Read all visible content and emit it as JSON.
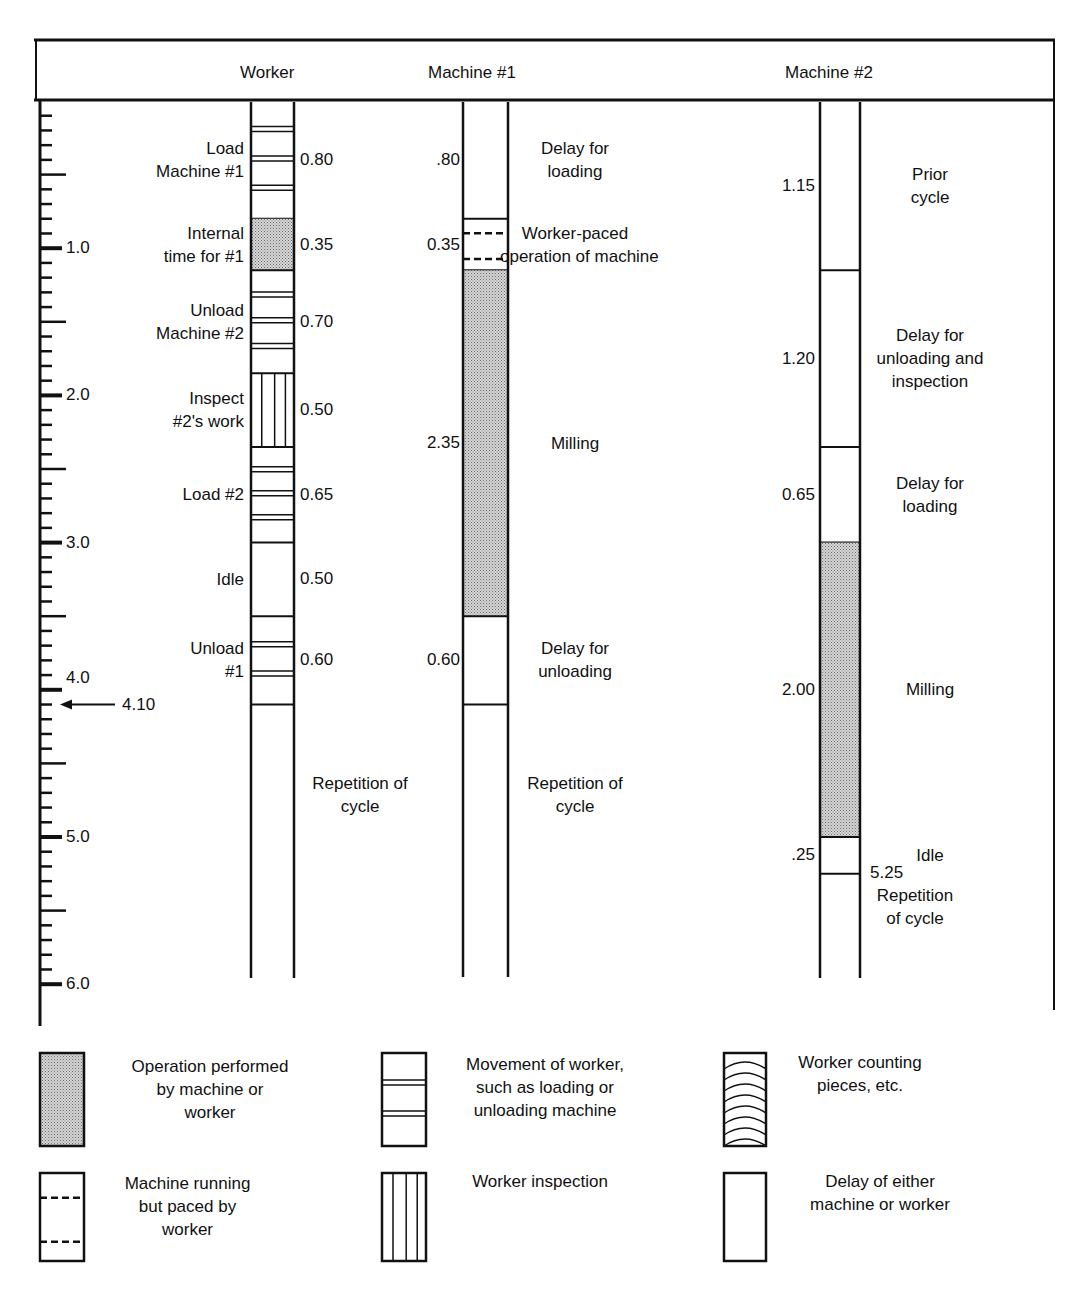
{
  "header": {
    "worker": "Worker",
    "machine1": "Machine #1",
    "machine2": "Machine #2"
  },
  "axis": {
    "ticks": [
      "1.0",
      "2.0",
      "3.0",
      "4.0",
      "5.0",
      "6.0"
    ],
    "marker_label": "4.10",
    "marker_value": 4.1,
    "min": 0,
    "max": 6.0,
    "minor_step": 0.1
  },
  "worker": {
    "segments": [
      {
        "label": "Load\nMachine #1",
        "duration": "0.80",
        "type": "movement"
      },
      {
        "label": "Internal\ntime for #1",
        "duration": "0.35",
        "type": "operation"
      },
      {
        "label": "Unload\nMachine #2",
        "duration": "0.70",
        "type": "movement"
      },
      {
        "label": "Inspect\n#2's work",
        "duration": "0.50",
        "type": "inspection"
      },
      {
        "label": "Load #2",
        "duration": "0.65",
        "type": "movement"
      },
      {
        "label": "Idle",
        "duration": "0.50",
        "type": "delay"
      },
      {
        "label": "Unload\n#1",
        "duration": "0.60",
        "type": "movement"
      }
    ],
    "repetition": "Repetition of\ncycle"
  },
  "machine1": {
    "segments": [
      {
        "label": "Delay for\nloading",
        "duration": ".80",
        "type": "delay"
      },
      {
        "label": "Worker-paced\noperation of machine",
        "duration": "0.35",
        "type": "paced"
      },
      {
        "label": "Milling",
        "duration": "2.35",
        "type": "operation"
      },
      {
        "label": "Delay for\nunloading",
        "duration": "0.60",
        "type": "delay"
      }
    ],
    "repetition": "Repetition of\ncycle"
  },
  "machine2": {
    "segments": [
      {
        "label": "Prior\ncycle",
        "duration": "1.15",
        "type": "delay"
      },
      {
        "label": "Delay for\nunloading and\ninspection",
        "duration": "1.20",
        "type": "delay"
      },
      {
        "label": "Delay for\nloading",
        "duration": "0.65",
        "type": "delay"
      },
      {
        "label": "Milling",
        "duration": "2.00",
        "type": "operation"
      },
      {
        "label": "Idle",
        "duration": ".25",
        "type": "delay"
      }
    ],
    "end_time": "5.25",
    "repetition": "Repetition\nof cycle"
  },
  "legend": [
    {
      "symbol": "operation",
      "label": "Operation performed\nby machine or\nworker"
    },
    {
      "symbol": "movement",
      "label": "Movement of worker,\nsuch as loading or\nunloading machine"
    },
    {
      "symbol": "counting",
      "label": "Worker counting\npieces, etc."
    },
    {
      "symbol": "paced",
      "label": "Machine running\nbut paced by\nworker"
    },
    {
      "symbol": "inspection",
      "label": "Worker inspection"
    },
    {
      "symbol": "delay",
      "label": "Delay of either\nmachine or worker"
    }
  ],
  "chart_data": {
    "type": "table",
    "columns": [
      "Worker",
      "Machine #1",
      "Machine #2"
    ],
    "axis": {
      "label": "time",
      "ticks": [
        1.0,
        2.0,
        3.0,
        4.0,
        5.0,
        6.0
      ],
      "range": [
        0,
        6.0
      ]
    },
    "cycle_time_marker": 4.1,
    "worker": [
      {
        "activity": "Load Machine #1",
        "start": 0.0,
        "duration": 0.8,
        "symbol": "movement"
      },
      {
        "activity": "Internal time for #1",
        "start": 0.8,
        "duration": 0.35,
        "symbol": "operation"
      },
      {
        "activity": "Unload Machine #2",
        "start": 1.15,
        "duration": 0.7,
        "symbol": "movement"
      },
      {
        "activity": "Inspect #2's work",
        "start": 1.85,
        "duration": 0.5,
        "symbol": "inspection"
      },
      {
        "activity": "Load #2",
        "start": 2.35,
        "duration": 0.65,
        "symbol": "movement"
      },
      {
        "activity": "Idle",
        "start": 3.0,
        "duration": 0.5,
        "symbol": "delay"
      },
      {
        "activity": "Unload #1",
        "start": 3.5,
        "duration": 0.6,
        "symbol": "movement"
      }
    ],
    "machine1": [
      {
        "activity": "Delay for loading",
        "start": 0.0,
        "duration": 0.8,
        "symbol": "delay"
      },
      {
        "activity": "Worker-paced operation of machine",
        "start": 0.8,
        "duration": 0.35,
        "symbol": "paced"
      },
      {
        "activity": "Milling",
        "start": 1.15,
        "duration": 2.35,
        "symbol": "operation"
      },
      {
        "activity": "Delay for unloading",
        "start": 3.5,
        "duration": 0.6,
        "symbol": "delay"
      }
    ],
    "machine2": [
      {
        "activity": "Prior cycle",
        "start": 0.0,
        "duration": 1.15,
        "symbol": "delay"
      },
      {
        "activity": "Delay for unloading and inspection",
        "start": 1.15,
        "duration": 1.2,
        "symbol": "delay"
      },
      {
        "activity": "Delay for loading",
        "start": 2.35,
        "duration": 0.65,
        "symbol": "delay"
      },
      {
        "activity": "Milling",
        "start": 3.0,
        "duration": 2.0,
        "symbol": "operation"
      },
      {
        "activity": "Idle",
        "start": 5.0,
        "duration": 0.25,
        "symbol": "delay"
      }
    ],
    "machine2_end": 5.25
  }
}
